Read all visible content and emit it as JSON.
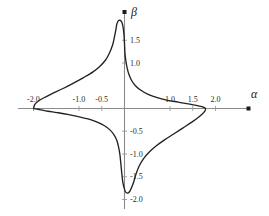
{
  "figure": {
    "background_color": "#ffffff",
    "axis_color": "#8a8a8a",
    "curve_color": "#222222",
    "text_color": "#2b2b2b",
    "x_axis_label": "α",
    "y_axis_label": "β"
  },
  "chart_data": {
    "type": "line",
    "title": "",
    "xlabel": "α",
    "ylabel": "β",
    "xlim": [
      -2.3,
      2.6
    ],
    "ylim": [
      -2.35,
      2.15
    ],
    "grid": false,
    "legend": null,
    "x_ticks": [
      -2.0,
      -1.0,
      -0.5,
      1.0,
      1.5,
      2.0
    ],
    "x_tick_labels": [
      "-2.0",
      "-1.0",
      "-0.5",
      "1.0",
      "1.5",
      "2.0"
    ],
    "y_ticks": [
      1.5,
      1.0,
      -0.5,
      -1.0,
      -1.5,
      -2.0
    ],
    "y_tick_labels": [
      "1.5",
      "1.0",
      "-0.5",
      "-1.0",
      "-1.5",
      "-2.0"
    ],
    "series": [
      {
        "name": "closed-curve",
        "closed": true,
        "points": [
          [
            -2.0,
            0.0
          ],
          [
            -1.97,
            0.09
          ],
          [
            -1.9,
            0.16
          ],
          [
            -1.8,
            0.22
          ],
          [
            -1.6,
            0.32
          ],
          [
            -1.35,
            0.44
          ],
          [
            -1.1,
            0.57
          ],
          [
            -0.9,
            0.68
          ],
          [
            -0.7,
            0.8
          ],
          [
            -0.55,
            0.92
          ],
          [
            -0.42,
            1.06
          ],
          [
            -0.33,
            1.22
          ],
          [
            -0.26,
            1.4
          ],
          [
            -0.22,
            1.58
          ],
          [
            -0.19,
            1.73
          ],
          [
            -0.17,
            1.85
          ],
          [
            -0.14,
            1.92
          ],
          [
            -0.1,
            1.94
          ],
          [
            -0.06,
            1.9
          ],
          [
            -0.03,
            1.78
          ],
          [
            -0.01,
            1.6
          ],
          [
            0.0,
            1.42
          ],
          [
            0.01,
            1.22
          ],
          [
            0.03,
            1.05
          ],
          [
            0.06,
            0.88
          ],
          [
            0.1,
            0.74
          ],
          [
            0.16,
            0.61
          ],
          [
            0.24,
            0.5
          ],
          [
            0.36,
            0.4
          ],
          [
            0.52,
            0.31
          ],
          [
            0.72,
            0.24
          ],
          [
            0.95,
            0.18
          ],
          [
            1.18,
            0.14
          ],
          [
            1.4,
            0.1
          ],
          [
            1.58,
            0.07
          ],
          [
            1.7,
            0.04
          ],
          [
            1.77,
            0.01
          ],
          [
            1.78,
            -0.03
          ],
          [
            1.74,
            -0.09
          ],
          [
            1.64,
            -0.18
          ],
          [
            1.48,
            -0.3
          ],
          [
            1.28,
            -0.43
          ],
          [
            1.08,
            -0.56
          ],
          [
            0.88,
            -0.69
          ],
          [
            0.7,
            -0.82
          ],
          [
            0.55,
            -0.95
          ],
          [
            0.42,
            -1.1
          ],
          [
            0.32,
            -1.27
          ],
          [
            0.25,
            -1.45
          ],
          [
            0.2,
            -1.62
          ],
          [
            0.15,
            -1.75
          ],
          [
            0.11,
            -1.83
          ],
          [
            0.06,
            -1.86
          ],
          [
            0.02,
            -1.83
          ],
          [
            -0.01,
            -1.74
          ],
          [
            -0.04,
            -1.6
          ],
          [
            -0.06,
            -1.42
          ],
          [
            -0.08,
            -1.22
          ],
          [
            -0.1,
            -1.02
          ],
          [
            -0.13,
            -0.85
          ],
          [
            -0.17,
            -0.7
          ],
          [
            -0.23,
            -0.58
          ],
          [
            -0.32,
            -0.47
          ],
          [
            -0.44,
            -0.38
          ],
          [
            -0.6,
            -0.3
          ],
          [
            -0.8,
            -0.23
          ],
          [
            -1.02,
            -0.18
          ],
          [
            -1.25,
            -0.13
          ],
          [
            -1.48,
            -0.09
          ],
          [
            -1.68,
            -0.06
          ],
          [
            -1.84,
            -0.03
          ],
          [
            -1.94,
            -0.01
          ],
          [
            -2.0,
            0.0
          ]
        ]
      }
    ]
  },
  "axis_markers": {
    "x_arrow_label": "x-axis-endpoint-marker",
    "y_arrow_label": "y-axis-endpoint-marker"
  }
}
